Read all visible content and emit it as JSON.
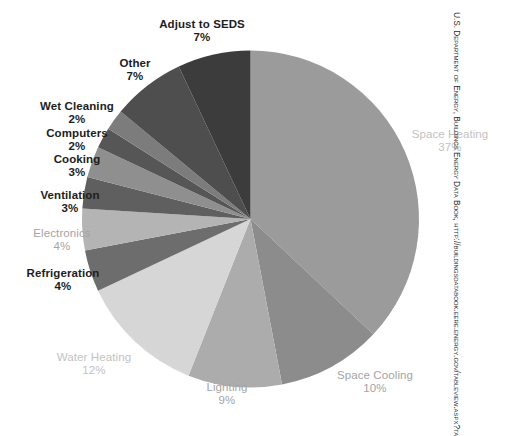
{
  "chart_data": {
    "type": "pie",
    "title": "",
    "subtitle": "",
    "xlabel": "",
    "ylabel": "",
    "legend_position": "none",
    "grid": false,
    "units": "percent",
    "total": 100,
    "start_angle_deg": 0,
    "direction": "clockwise",
    "categories": [
      "Space Heating",
      "Space Cooling",
      "Lighting",
      "Water Heating",
      "Refrigeration",
      "Electronics",
      "Ventilation",
      "Cooking",
      "Computers",
      "Wet Cleaning",
      "Other",
      "Adjust to SEDS"
    ],
    "values": [
      37,
      10,
      9,
      12,
      4,
      4,
      3,
      3,
      2,
      2,
      7,
      7
    ],
    "slices": [
      {
        "label": "Space Heating",
        "value": 37,
        "pct_text": "37%",
        "color": "#9b9b9b",
        "label_tone": "faint"
      },
      {
        "label": "Space Cooling",
        "value": 10,
        "pct_text": "10%",
        "color": "#8c8c8c",
        "label_tone": "light"
      },
      {
        "label": "Lighting",
        "value": 9,
        "pct_text": "9%",
        "color": "#acacac",
        "label_tone": "light"
      },
      {
        "label": "Water Heating",
        "value": 12,
        "pct_text": "12%",
        "color": "#d6d6d6",
        "label_tone": "faint"
      },
      {
        "label": "Refrigeration",
        "value": 4,
        "pct_text": "4%",
        "color": "#6d6d6d",
        "label_tone": "dark"
      },
      {
        "label": "Electronics",
        "value": 4,
        "pct_text": "4%",
        "color": "#b4b4b4",
        "label_tone": "light"
      },
      {
        "label": "Ventilation",
        "value": 3,
        "pct_text": "3%",
        "color": "#5f5f5f",
        "label_tone": "dark"
      },
      {
        "label": "Cooking",
        "value": 3,
        "pct_text": "3%",
        "color": "#8f8f8f",
        "label_tone": "dark"
      },
      {
        "label": "Computers",
        "value": 2,
        "pct_text": "2%",
        "color": "#565656",
        "label_tone": "dark"
      },
      {
        "label": "Wet Cleaning",
        "value": 2,
        "pct_text": "2%",
        "color": "#7c7c7c",
        "label_tone": "dark"
      },
      {
        "label": "Other",
        "value": 7,
        "pct_text": "7%",
        "color": "#4e4e4e",
        "label_tone": "dark"
      },
      {
        "label": "Adjust to SEDS",
        "value": 7,
        "pct_text": "7%",
        "color": "#3c3c3c",
        "label_tone": "dark"
      }
    ]
  },
  "labels": {
    "space_heating": {
      "name": "Space Heating",
      "pct": "37%"
    },
    "space_cooling": {
      "name": "Space Cooling",
      "pct": "10%"
    },
    "lighting": {
      "name": "Lighting",
      "pct": "9%"
    },
    "water_heating": {
      "name": "Water Heating",
      "pct": "12%"
    },
    "refrigeration": {
      "name": "Refrigeration",
      "pct": "4%"
    },
    "electronics": {
      "name": "Electronics",
      "pct": "4%"
    },
    "ventilation": {
      "name": "Ventilation",
      "pct": "3%"
    },
    "cooking": {
      "name": "Cooking",
      "pct": "3%"
    },
    "computers": {
      "name": "Computers",
      "pct": "2%"
    },
    "wet_cleaning": {
      "name": "Wet Cleaning",
      "pct": "2%"
    },
    "other": {
      "name": "Other",
      "pct": "7%"
    },
    "adjust_to_seds": {
      "name": "Adjust to SEDS",
      "pct": "7%"
    }
  },
  "source": {
    "text": "U.S. Department of Energy, Buildings Energy Data Book, http://buildingsdatabook.eere.energy.gov/tableview.aspx?table=1.1.4"
  }
}
